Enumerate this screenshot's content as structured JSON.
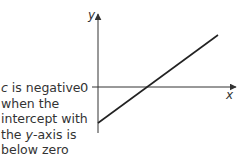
{
  "diagram": {
    "title": "",
    "axes": {
      "x_label": "x",
      "y_label": "y",
      "origin_label": "0"
    },
    "line": {
      "description": "straight line with positive gradient and negative y-intercept",
      "start": {
        "x": 98,
        "y": 123
      },
      "end": {
        "x": 218,
        "y": 35
      }
    },
    "caption": {
      "lines": [
        {
          "pre": "",
          "ital": "c",
          "post": " is negative"
        },
        {
          "pre": "when the",
          "ital": "",
          "post": ""
        },
        {
          "pre": "intercept with",
          "ital": "",
          "post": ""
        },
        {
          "pre": "the ",
          "ital": "y",
          "post": "-axis is"
        },
        {
          "pre": "below zero",
          "ital": "",
          "post": ""
        }
      ]
    },
    "colors": {
      "axis": "#333333",
      "line": "#222222",
      "text": "#333333"
    }
  }
}
